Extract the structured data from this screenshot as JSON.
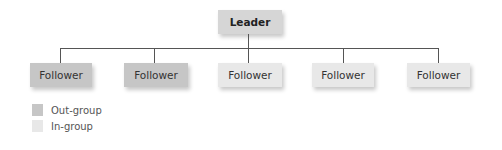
{
  "diagram": {
    "leader": {
      "label": "Leader",
      "color": "#d6d6d6"
    },
    "followers": [
      {
        "label": "Follower",
        "group": "out",
        "color": "#c6c6c6"
      },
      {
        "label": "Follower",
        "group": "out",
        "color": "#c6c6c6"
      },
      {
        "label": "Follower",
        "group": "in",
        "color": "#e8e8e8"
      },
      {
        "label": "Follower",
        "group": "in",
        "color": "#e8e8e8"
      },
      {
        "label": "Follower",
        "group": "in",
        "color": "#e8e8e8"
      }
    ],
    "legend": [
      {
        "label": "Out-group",
        "color": "#c6c6c6"
      },
      {
        "label": "In-group",
        "color": "#e8e8e8"
      }
    ],
    "line_color": "#555555"
  }
}
